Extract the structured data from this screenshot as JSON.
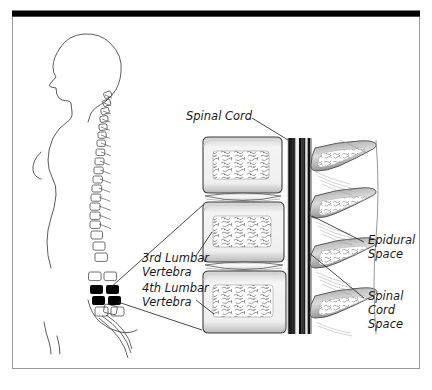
{
  "figure": {
    "title_visible": false,
    "background_color": "#ffffff",
    "frame": {
      "top_bar_color": "#000000",
      "border_color": "#9a9a9a",
      "x": 12,
      "y": 11,
      "width": 408,
      "height": 358
    }
  },
  "labels": {
    "spinal_cord": {
      "text": "Spinal Cord",
      "x": 186,
      "y": 120
    },
    "third_lumbar": {
      "line1": "3rd Lumbar",
      "line2": "Vertebra",
      "x": 142,
      "y": 262
    },
    "fourth_lumbar": {
      "line1": "4th Lumbar",
      "line2": "Vertebra",
      "x": 142,
      "y": 292
    },
    "epidural_space": {
      "line1": "Epidural",
      "line2": "Space",
      "x": 368,
      "y": 244
    },
    "spinal_cord_space": {
      "line1": "Spinal",
      "line2": "Cord",
      "line3": "Space",
      "x": 368,
      "y": 300
    }
  },
  "anatomy": {
    "body_profile_name": "human-body-profile-left-facing",
    "highlighted_vertebrae": [
      "3rd Lumbar Vertebra",
      "4th Lumbar Vertebra"
    ],
    "highlight_color": "#000000",
    "magnified_vertebral_bodies": 3,
    "intervertebral_discs": 2,
    "spinous_processes": 4,
    "bone_texture": "trabecular-stipple",
    "outline_color": "#3a3a3a"
  }
}
